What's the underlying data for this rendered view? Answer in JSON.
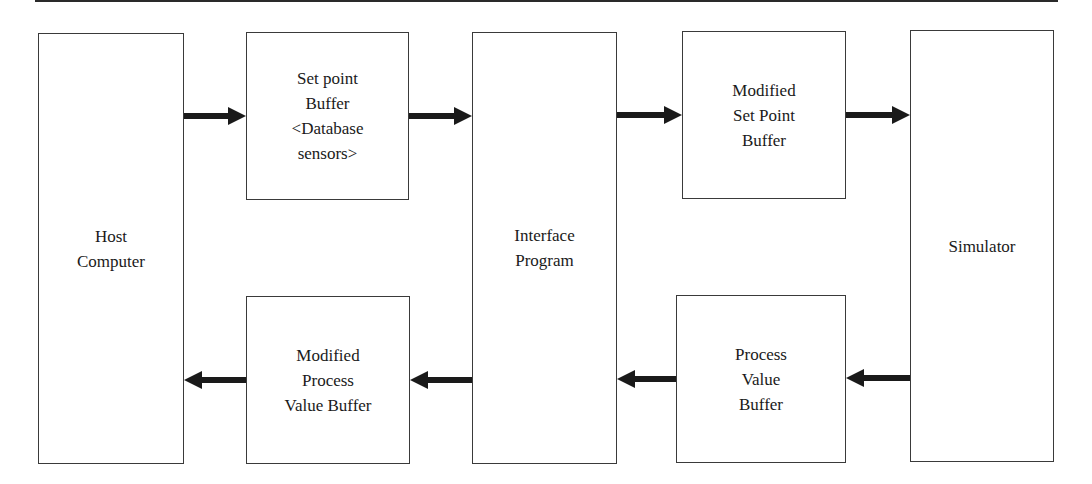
{
  "diagram": {
    "type": "block-flow",
    "blocks": {
      "host_computer": {
        "label": "Host\nComputer"
      },
      "set_point_buffer": {
        "label": "Set point\nBuffer\n<Database\nsensors>"
      },
      "interface_program": {
        "label": "Interface\nProgram"
      },
      "modified_set_point_buffer": {
        "label": "Modified\nSet Point\nBuffer"
      },
      "simulator": {
        "label": "Simulator"
      },
      "modified_process_value_buffer": {
        "label": "Modified\nProcess\nValue Buffer"
      },
      "process_value_buffer": {
        "label": "Process\nValue\nBuffer"
      }
    },
    "edges": [
      {
        "from": "Host Computer",
        "to": "Set point Buffer <Database sensors>"
      },
      {
        "from": "Set point Buffer <Database sensors>",
        "to": "Interface Program"
      },
      {
        "from": "Interface Program",
        "to": "Modified Set Point Buffer"
      },
      {
        "from": "Modified Set Point Buffer",
        "to": "Simulator"
      },
      {
        "from": "Simulator",
        "to": "Process Value Buffer"
      },
      {
        "from": "Process Value Buffer",
        "to": "Interface Program"
      },
      {
        "from": "Interface Program",
        "to": "Modified Process Value Buffer"
      },
      {
        "from": "Modified Process Value Buffer",
        "to": "Host Computer"
      }
    ],
    "colors": {
      "stroke": "#3a3a3a",
      "arrow": "#1a1a1a",
      "background": "#ffffff",
      "text": "#1a1a1a"
    }
  }
}
